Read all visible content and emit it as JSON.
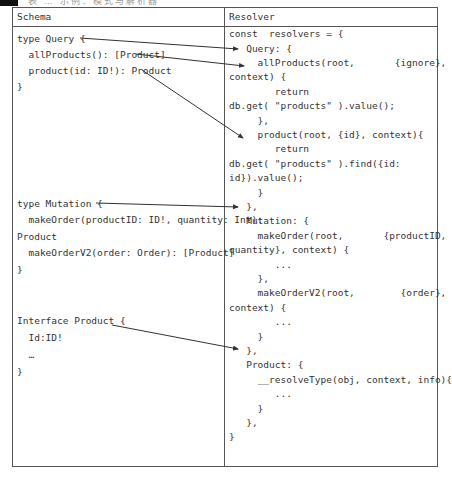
{
  "caption": {
    "text": "表 … 示例：模式与解析器"
  },
  "table": {
    "headers": {
      "schema": "Schema",
      "resolver": "Resolver"
    },
    "schema_lines": [
      {
        "text": "type Query {",
        "x": 17,
        "y": 33
      },
      {
        "text": "  allProducts(): [Product]",
        "x": 17,
        "y": 49
      },
      {
        "text": "  product(id: ID!): Product",
        "x": 17,
        "y": 65
      },
      {
        "text": "}",
        "x": 17,
        "y": 81
      },
      {
        "text": "type Mutation {",
        "x": 17,
        "y": 198
      },
      {
        "text": "  makeOrder(productID: ID!, quantity: Int):",
        "x": 17,
        "y": 214
      },
      {
        "text": "Product",
        "x": 17,
        "y": 231
      },
      {
        "text": "  makeOrderV2(order: Order): [Product]",
        "x": 17,
        "y": 247
      },
      {
        "text": "}",
        "x": 17,
        "y": 264
      },
      {
        "text": "Interface Product {",
        "x": 17,
        "y": 315
      },
      {
        "text": "  Id:ID!",
        "x": 17,
        "y": 332
      },
      {
        "text": "  …",
        "x": 17,
        "y": 349
      },
      {
        "text": "}",
        "x": 17,
        "y": 366
      }
    ],
    "resolver_lines": [
      {
        "text": "const  resolvers = {",
        "x": 229,
        "y": 28
      },
      {
        "text": "   Query: {",
        "x": 229,
        "y": 43
      },
      {
        "text": "     allProducts(root,       {ignore},",
        "x": 229,
        "y": 57
      },
      {
        "text": "context) {",
        "x": 229,
        "y": 71
      },
      {
        "text": "        return",
        "x": 229,
        "y": 86
      },
      {
        "text": "db.get( \"products\" ).value();",
        "x": 229,
        "y": 100
      },
      {
        "text": "     },",
        "x": 229,
        "y": 115
      },
      {
        "text": "     product(root, {id}, context){",
        "x": 229,
        "y": 129
      },
      {
        "text": "        return",
        "x": 229,
        "y": 143
      },
      {
        "text": "db.get( \"products\" ).find({id:",
        "x": 229,
        "y": 158
      },
      {
        "text": "id}).value();",
        "x": 229,
        "y": 172
      },
      {
        "text": "     }",
        "x": 229,
        "y": 187
      },
      {
        "text": "   },",
        "x": 229,
        "y": 201
      },
      {
        "text": "   Mutation: {",
        "x": 229,
        "y": 215
      },
      {
        "text": "     makeOrder(root,       {productID,",
        "x": 229,
        "y": 230
      },
      {
        "text": "quantity}, context) {",
        "x": 229,
        "y": 244
      },
      {
        "text": "        ...",
        "x": 229,
        "y": 259
      },
      {
        "text": "     },",
        "x": 229,
        "y": 273
      },
      {
        "text": "     makeOrderV2(root,        {order},",
        "x": 229,
        "y": 287
      },
      {
        "text": "context) {",
        "x": 229,
        "y": 302
      },
      {
        "text": "        ...",
        "x": 229,
        "y": 316
      },
      {
        "text": "     }",
        "x": 229,
        "y": 331
      },
      {
        "text": "   },",
        "x": 229,
        "y": 345
      },
      {
        "text": "   Product: {",
        "x": 229,
        "y": 359
      },
      {
        "text": "     __resolveType(obj, context, info){",
        "x": 229,
        "y": 374
      },
      {
        "text": "        ...",
        "x": 229,
        "y": 388
      },
      {
        "text": "     }",
        "x": 229,
        "y": 403
      },
      {
        "text": "   },",
        "x": 229,
        "y": 417
      },
      {
        "text": "}",
        "x": 229,
        "y": 431
      }
    ]
  },
  "arrows": [
    {
      "from": "type Query",
      "to": "Query",
      "x1": 80,
      "y1": 38,
      "x2": 238,
      "y2": 49
    },
    {
      "from": "allProducts(): [Product]",
      "to": "allProducts(root, ...)",
      "x1": 136,
      "y1": 54,
      "x2": 244,
      "y2": 66
    },
    {
      "from": "product(id: ID!): Product",
      "to": "product(root, {id}, context)",
      "x1": 142,
      "y1": 70,
      "x2": 243,
      "y2": 138
    },
    {
      "from": "type Mutation",
      "to": "}, (end of Query)",
      "x1": 96,
      "y1": 203,
      "x2": 238,
      "y2": 207
    },
    {
      "from": "Interface Product",
      "to": "}, (end of Mutation)",
      "x1": 112,
      "y1": 325,
      "x2": 238,
      "y2": 349
    }
  ],
  "colors": {
    "border": "#555555",
    "text": "#333333",
    "arrow": "#333333"
  }
}
